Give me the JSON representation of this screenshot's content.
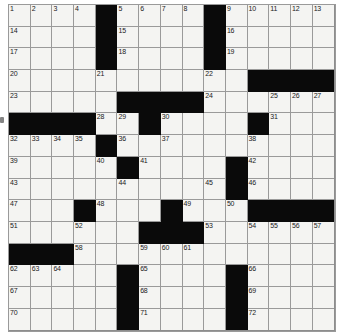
{
  "puzzle": {
    "title": "Crossword Puzzle Grid",
    "rows": 15,
    "cols": 15,
    "cell_size": 21.7,
    "origin_x": 8,
    "origin_y": 4,
    "block_color": "#0a0a0a",
    "cell_color": "#f4f4f2",
    "line_color": "#9a9a9a",
    "number_color": "#1a1a1a",
    "highest_number": 72,
    "grid": [
      [
        "o",
        "o",
        "o",
        "o",
        "#",
        "o",
        "o",
        "o",
        "o",
        "#",
        "o",
        "o",
        "o",
        "o",
        "o"
      ],
      [
        "o",
        "o",
        "o",
        "o",
        "#",
        "o",
        "o",
        "o",
        "o",
        "#",
        "o",
        "o",
        "o",
        "o",
        "o"
      ],
      [
        "o",
        "o",
        "o",
        "o",
        "#",
        "o",
        "o",
        "o",
        "o",
        "#",
        "o",
        "o",
        "o",
        "o",
        "o"
      ],
      [
        "o",
        "o",
        "o",
        "o",
        "o",
        "o",
        "o",
        "o",
        "o",
        "o",
        "o",
        "#",
        "#",
        "#",
        "#"
      ],
      [
        "o",
        "o",
        "o",
        "o",
        "o",
        "#",
        "#",
        "#",
        "#",
        "o",
        "o",
        "o",
        "o",
        "o",
        "o"
      ],
      [
        "#",
        "#",
        "#",
        "#",
        "o",
        "o",
        "#",
        "o",
        "o",
        "o",
        "o",
        "#",
        "o",
        "o",
        "o"
      ],
      [
        "o",
        "o",
        "o",
        "o",
        "#",
        "o",
        "o",
        "o",
        "o",
        "o",
        "o",
        "o",
        "o",
        "o",
        "o"
      ],
      [
        "o",
        "o",
        "o",
        "o",
        "o",
        "#",
        "o",
        "o",
        "o",
        "o",
        "#",
        "o",
        "o",
        "o",
        "o"
      ],
      [
        "o",
        "o",
        "o",
        "o",
        "o",
        "o",
        "o",
        "o",
        "o",
        "o",
        "#",
        "o",
        "o",
        "o",
        "o"
      ],
      [
        "o",
        "o",
        "o",
        "#",
        "o",
        "o",
        "o",
        "#",
        "o",
        "o",
        "o",
        "#",
        "#",
        "#",
        "#"
      ],
      [
        "o",
        "o",
        "o",
        "o",
        "o",
        "o",
        "#",
        "#",
        "#",
        "o",
        "o",
        "o",
        "o",
        "o",
        "o"
      ],
      [
        "#",
        "#",
        "#",
        "o",
        "o",
        "o",
        "o",
        "o",
        "o",
        "o",
        "o",
        "o",
        "o",
        "o",
        "o"
      ],
      [
        "o",
        "o",
        "o",
        "o",
        "o",
        "#",
        "o",
        "o",
        "o",
        "o",
        "#",
        "o",
        "o",
        "o",
        "o"
      ],
      [
        "o",
        "o",
        "o",
        "o",
        "o",
        "#",
        "o",
        "o",
        "o",
        "o",
        "#",
        "o",
        "o",
        "o",
        "o"
      ],
      [
        "o",
        "o",
        "o",
        "o",
        "o",
        "#",
        "o",
        "o",
        "o",
        "o",
        "#",
        "o",
        "o",
        "o",
        "o"
      ]
    ],
    "numbers": [
      {
        "row": 0,
        "col": 0,
        "n": "1"
      },
      {
        "row": 0,
        "col": 1,
        "n": "2"
      },
      {
        "row": 0,
        "col": 2,
        "n": "3"
      },
      {
        "row": 0,
        "col": 3,
        "n": "4"
      },
      {
        "row": 0,
        "col": 5,
        "n": "5"
      },
      {
        "row": 0,
        "col": 6,
        "n": "6"
      },
      {
        "row": 0,
        "col": 7,
        "n": "7"
      },
      {
        "row": 0,
        "col": 8,
        "n": "8"
      },
      {
        "row": 0,
        "col": 10,
        "n": "9"
      },
      {
        "row": 0,
        "col": 11,
        "n": "10"
      },
      {
        "row": 0,
        "col": 12,
        "n": "11"
      },
      {
        "row": 0,
        "col": 13,
        "n": "12"
      },
      {
        "row": 0,
        "col": 14,
        "n": "13"
      },
      {
        "row": 1,
        "col": 0,
        "n": "14"
      },
      {
        "row": 1,
        "col": 5,
        "n": "15"
      },
      {
        "row": 1,
        "col": 10,
        "n": "16"
      },
      {
        "row": 2,
        "col": 0,
        "n": "17"
      },
      {
        "row": 2,
        "col": 5,
        "n": "18"
      },
      {
        "row": 2,
        "col": 10,
        "n": "19"
      },
      {
        "row": 3,
        "col": 0,
        "n": "20"
      },
      {
        "row": 3,
        "col": 4,
        "n": "21"
      },
      {
        "row": 3,
        "col": 9,
        "n": "22"
      },
      {
        "row": 4,
        "col": 0,
        "n": "23"
      },
      {
        "row": 4,
        "col": 9,
        "n": "24"
      },
      {
        "row": 4,
        "col": 12,
        "n": "25"
      },
      {
        "row": 4,
        "col": 13,
        "n": "26"
      },
      {
        "row": 4,
        "col": 14,
        "n": "27"
      },
      {
        "row": 5,
        "col": 4,
        "n": "28"
      },
      {
        "row": 5,
        "col": 5,
        "n": "29"
      },
      {
        "row": 5,
        "col": 7,
        "n": "30"
      },
      {
        "row": 5,
        "col": 12,
        "n": "31"
      },
      {
        "row": 6,
        "col": 0,
        "n": "32"
      },
      {
        "row": 6,
        "col": 1,
        "n": "33"
      },
      {
        "row": 6,
        "col": 2,
        "n": "34"
      },
      {
        "row": 6,
        "col": 3,
        "n": "35"
      },
      {
        "row": 6,
        "col": 5,
        "n": "36"
      },
      {
        "row": 6,
        "col": 7,
        "n": "37"
      },
      {
        "row": 6,
        "col": 11,
        "n": "38"
      },
      {
        "row": 7,
        "col": 0,
        "n": "39"
      },
      {
        "row": 7,
        "col": 4,
        "n": "40"
      },
      {
        "row": 7,
        "col": 6,
        "n": "41"
      },
      {
        "row": 7,
        "col": 11,
        "n": "42"
      },
      {
        "row": 8,
        "col": 0,
        "n": "43"
      },
      {
        "row": 8,
        "col": 5,
        "n": "44"
      },
      {
        "row": 8,
        "col": 9,
        "n": "45"
      },
      {
        "row": 8,
        "col": 11,
        "n": "46"
      },
      {
        "row": 9,
        "col": 0,
        "n": "47"
      },
      {
        "row": 9,
        "col": 4,
        "n": "48"
      },
      {
        "row": 9,
        "col": 8,
        "n": "49"
      },
      {
        "row": 9,
        "col": 10,
        "n": "50"
      },
      {
        "row": 10,
        "col": 0,
        "n": "51"
      },
      {
        "row": 10,
        "col": 3,
        "n": "52"
      },
      {
        "row": 10,
        "col": 9,
        "n": "53"
      },
      {
        "row": 10,
        "col": 11,
        "n": "54"
      },
      {
        "row": 10,
        "col": 12,
        "n": "55"
      },
      {
        "row": 10,
        "col": 13,
        "n": "56"
      },
      {
        "row": 10,
        "col": 14,
        "n": "57"
      },
      {
        "row": 11,
        "col": 3,
        "n": "58"
      },
      {
        "row": 11,
        "col": 6,
        "n": "59"
      },
      {
        "row": 11,
        "col": 7,
        "n": "60"
      },
      {
        "row": 11,
        "col": 8,
        "n": "61"
      },
      {
        "row": 12,
        "col": 0,
        "n": "62"
      },
      {
        "row": 12,
        "col": 1,
        "n": "63"
      },
      {
        "row": 12,
        "col": 2,
        "n": "64"
      },
      {
        "row": 12,
        "col": 6,
        "n": "65"
      },
      {
        "row": 12,
        "col": 11,
        "n": "66"
      },
      {
        "row": 13,
        "col": 0,
        "n": "67"
      },
      {
        "row": 13,
        "col": 6,
        "n": "68"
      },
      {
        "row": 13,
        "col": 11,
        "n": "69"
      },
      {
        "row": 14,
        "col": 0,
        "n": "70"
      },
      {
        "row": 14,
        "col": 6,
        "n": "71"
      },
      {
        "row": 14,
        "col": 11,
        "n": "72"
      }
    ],
    "letters": []
  }
}
